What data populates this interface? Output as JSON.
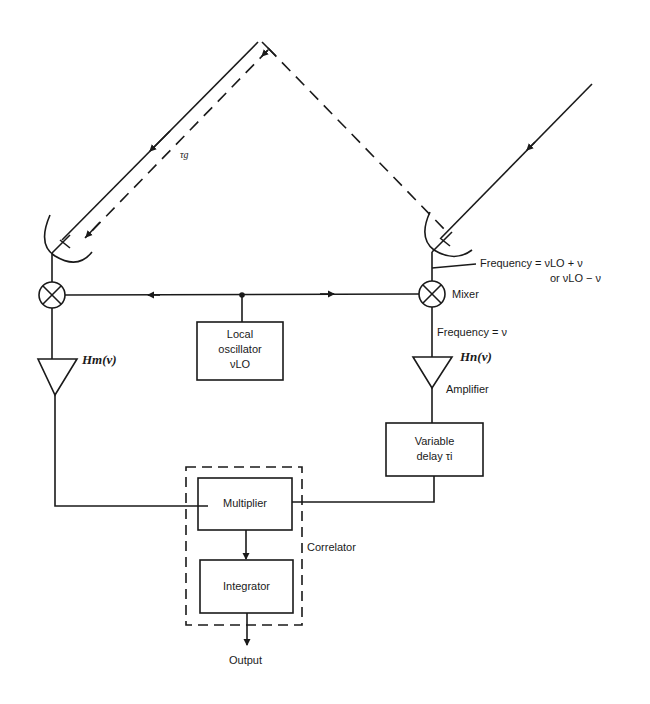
{
  "diagram": {
    "type": "block-diagram",
    "labels": {
      "geometric_delay": "τg",
      "rf_frequency_line1": "Frequency = νLO + ν",
      "rf_frequency_line2": "or νLO − ν",
      "mixer": "Mixer",
      "if_frequency": "Frequency = ν",
      "gain_m": "Hm(ν)",
      "gain_n": "Hn(ν)",
      "amplifier": "Amplifier",
      "correlator": "Correlator",
      "output": "Output"
    },
    "blocks": {
      "local_oscillator": {
        "line1": "Local",
        "line2": "oscillator",
        "line3": "νLO"
      },
      "variable_delay": {
        "line1": "Variable",
        "line2": "delay τi"
      },
      "multiplier": {
        "label": "Multiplier"
      },
      "integrator": {
        "label": "Integrator"
      }
    },
    "colors": {
      "ink": "#1a1a1a",
      "background": "#ffffff"
    }
  }
}
